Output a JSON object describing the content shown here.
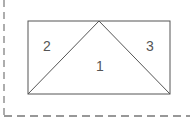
{
  "diagram": {
    "type": "geometric-partition",
    "colors": {
      "stroke": "#555555",
      "dashed_border": "#777777",
      "background": "#ffffff",
      "label": "#555555"
    },
    "rectangle": {
      "x1": 28,
      "y1": 21,
      "x2": 170,
      "y2": 94
    },
    "apex": {
      "x": 99,
      "y": 21
    },
    "regions": [
      {
        "id": "region-1",
        "label": "1",
        "x": 100,
        "y": 71
      },
      {
        "id": "region-2",
        "label": "2",
        "x": 47,
        "y": 51
      },
      {
        "id": "region-3",
        "label": "3",
        "x": 150,
        "y": 51
      }
    ],
    "border": {
      "style": "dashed",
      "vertical_x": 4,
      "horizontal_y": 116
    }
  }
}
